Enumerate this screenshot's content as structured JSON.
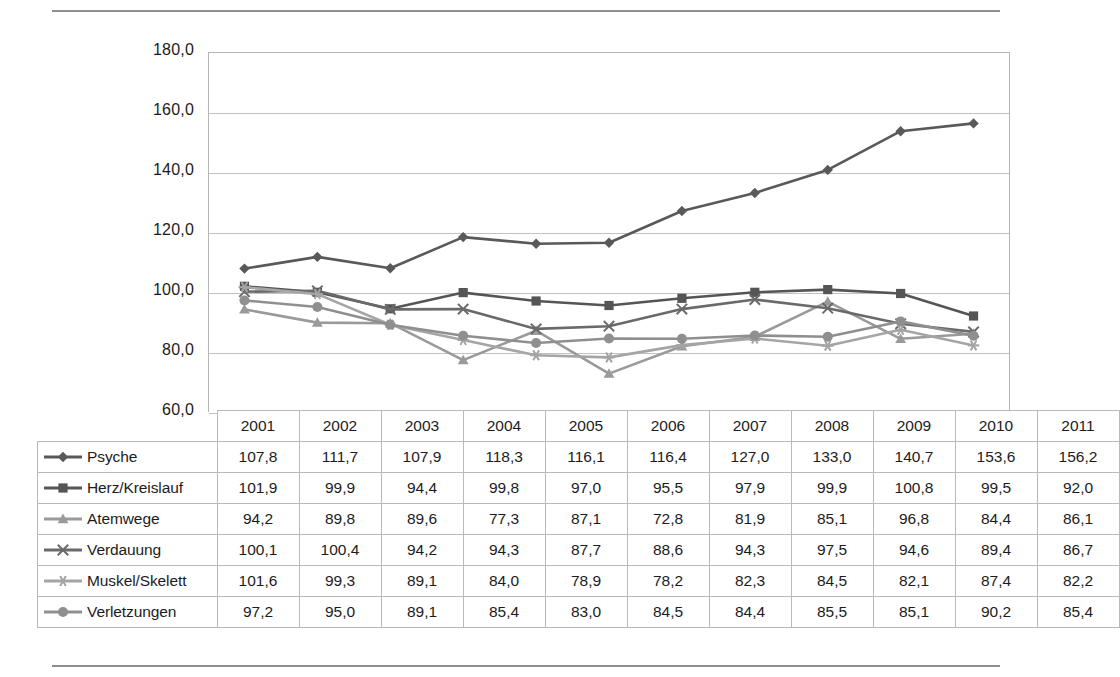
{
  "chart_data": {
    "type": "line",
    "title": "",
    "subtitle": "",
    "xlabel": "",
    "ylabel": "",
    "grid": true,
    "legend_position": "table-left",
    "ylim": [
      60.0,
      180.0
    ],
    "ytick_step": 20.0,
    "ytick_labels": [
      "180,0",
      "160,0",
      "140,0",
      "120,0",
      "100,0",
      "80,0",
      "60,0"
    ],
    "ytick_values": [
      180.0,
      160.0,
      140.0,
      120.0,
      100.0,
      80.0,
      60.0
    ],
    "categories": [
      "2001",
      "2002",
      "2003",
      "2004",
      "2005",
      "2006",
      "2007",
      "2008",
      "2009",
      "2010",
      "2011"
    ],
    "series": [
      {
        "name": "Psyche",
        "marker": "diamond",
        "color": "#595959",
        "values": [
          107.8,
          111.7,
          107.9,
          118.3,
          116.1,
          116.4,
          127.0,
          133.0,
          140.7,
          153.6,
          156.2
        ],
        "labels": [
          "107,8",
          "111,7",
          "107,9",
          "118,3",
          "116,1",
          "116,4",
          "127,0",
          "133,0",
          "140,7",
          "153,6",
          "156,2"
        ]
      },
      {
        "name": "Herz/Kreislauf",
        "marker": "square",
        "color": "#555555",
        "values": [
          101.9,
          99.9,
          94.4,
          99.8,
          97.0,
          95.5,
          97.9,
          99.9,
          100.8,
          99.5,
          92.0
        ],
        "labels": [
          "101,9",
          "99,9",
          "94,4",
          "99,8",
          "97,0",
          "95,5",
          "97,9",
          "99,9",
          "100,8",
          "99,5",
          "92,0"
        ]
      },
      {
        "name": "Atemwege",
        "marker": "triangle",
        "color": "#9a9a9a",
        "values": [
          94.2,
          89.8,
          89.6,
          77.3,
          87.1,
          72.8,
          81.9,
          85.1,
          96.8,
          84.4,
          86.1
        ],
        "labels": [
          "94,2",
          "89,8",
          "89,6",
          "77,3",
          "87,1",
          "72,8",
          "81,9",
          "85,1",
          "96,8",
          "84,4",
          "86,1"
        ]
      },
      {
        "name": "Verdauung",
        "marker": "x",
        "color": "#6a6a6a",
        "values": [
          100.1,
          100.4,
          94.2,
          94.3,
          87.7,
          88.6,
          94.3,
          97.5,
          94.6,
          89.4,
          86.7
        ],
        "labels": [
          "100,1",
          "100,4",
          "94,2",
          "94,3",
          "87,7",
          "88,6",
          "94,3",
          "97,5",
          "94,6",
          "89,4",
          "86,7"
        ]
      },
      {
        "name": "Muskel/Skelett",
        "marker": "asterisk",
        "color": "#a5a5a5",
        "values": [
          101.6,
          99.3,
          89.1,
          84.0,
          78.9,
          78.2,
          82.3,
          84.5,
          82.1,
          87.4,
          82.2
        ],
        "labels": [
          "101,6",
          "99,3",
          "89,1",
          "84,0",
          "78,9",
          "78,2",
          "82,3",
          "84,5",
          "82,1",
          "87,4",
          "82,2"
        ]
      },
      {
        "name": "Verletzungen",
        "marker": "circle",
        "color": "#8f8f8f",
        "values": [
          97.2,
          95.0,
          89.1,
          85.4,
          83.0,
          84.5,
          84.4,
          85.5,
          85.1,
          90.2,
          85.4
        ],
        "labels": [
          "97,2",
          "95,0",
          "89,1",
          "85,4",
          "83,0",
          "84,5",
          "84,4",
          "85,5",
          "85,1",
          "90,2",
          "85,4"
        ]
      }
    ]
  },
  "table": {
    "corner_label": "",
    "column_headers": [
      "2001",
      "2002",
      "2003",
      "2004",
      "2005",
      "2006",
      "2007",
      "2008",
      "2009",
      "2010",
      "2011"
    ],
    "rows": [
      {
        "label": "Psyche",
        "marker": "diamond",
        "values": [
          "107,8",
          "111,7",
          "107,9",
          "118,3",
          "116,1",
          "116,4",
          "127,0",
          "133,0",
          "140,7",
          "153,6",
          "156,2"
        ]
      },
      {
        "label": "Herz/Kreislauf",
        "marker": "square",
        "values": [
          "101,9",
          "99,9",
          "94,4",
          "99,8",
          "97,0",
          "95,5",
          "97,9",
          "99,9",
          "100,8",
          "99,5",
          "92,0"
        ]
      },
      {
        "label": "Atemwege",
        "marker": "triangle",
        "values": [
          "94,2",
          "89,8",
          "89,6",
          "77,3",
          "87,1",
          "72,8",
          "81,9",
          "85,1",
          "96,8",
          "84,4",
          "86,1"
        ]
      },
      {
        "label": "Verdauung",
        "marker": "x",
        "values": [
          "100,1",
          "100,4",
          "94,2",
          "94,3",
          "87,7",
          "88,6",
          "94,3",
          "97,5",
          "94,6",
          "89,4",
          "86,7"
        ]
      },
      {
        "label": "Muskel/Skelett",
        "marker": "asterisk",
        "values": [
          "101,6",
          "99,3",
          "89,1",
          "84,0",
          "78,9",
          "78,2",
          "82,3",
          "84,5",
          "82,1",
          "87,4",
          "82,2"
        ]
      },
      {
        "label": "Verletzungen",
        "marker": "circle",
        "values": [
          "97,2",
          "95,0",
          "89,1",
          "85,4",
          "83,0",
          "84,5",
          "84,4",
          "85,5",
          "85,1",
          "90,2",
          "85,4"
        ]
      }
    ]
  },
  "colors": {
    "rule": "#8d8d8d",
    "gridline": "#c2c2c2",
    "table_border": "#b9b9b9",
    "text": "#1c1c1c"
  }
}
